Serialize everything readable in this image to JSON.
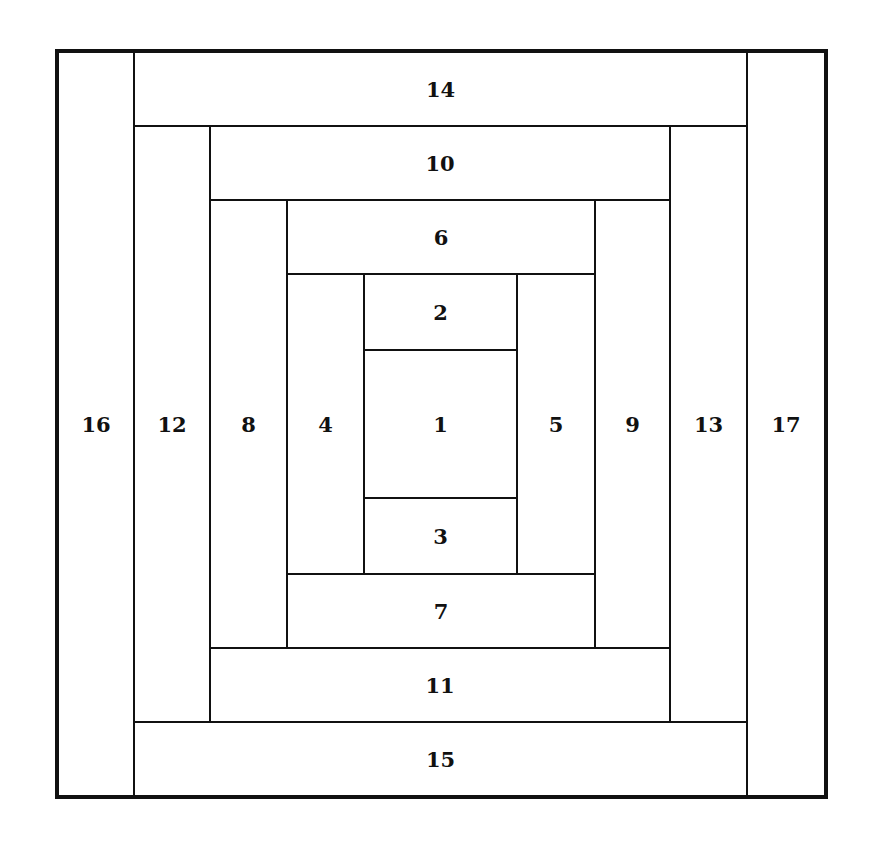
{
  "diagram": {
    "pieces": [
      {
        "label": "1",
        "x": 363,
        "y": 349,
        "w": 155,
        "h": 150
      },
      {
        "label": "2",
        "x": 363,
        "y": 273,
        "w": 155,
        "h": 78
      },
      {
        "label": "3",
        "x": 363,
        "y": 497,
        "w": 155,
        "h": 78
      },
      {
        "label": "4",
        "x": 286,
        "y": 273,
        "w": 79,
        "h": 302
      },
      {
        "label": "5",
        "x": 516,
        "y": 273,
        "w": 80,
        "h": 302
      },
      {
        "label": "6",
        "x": 286,
        "y": 199,
        "w": 310,
        "h": 76
      },
      {
        "label": "7",
        "x": 286,
        "y": 573,
        "w": 310,
        "h": 76
      },
      {
        "label": "8",
        "x": 209,
        "y": 199,
        "w": 79,
        "h": 450
      },
      {
        "label": "9",
        "x": 594,
        "y": 199,
        "w": 77,
        "h": 450
      },
      {
        "label": "10",
        "x": 209,
        "y": 125,
        "w": 462,
        "h": 76
      },
      {
        "label": "11",
        "x": 209,
        "y": 647,
        "w": 462,
        "h": 76
      },
      {
        "label": "12",
        "x": 133,
        "y": 125,
        "w": 78,
        "h": 598
      },
      {
        "label": "13",
        "x": 669,
        "y": 125,
        "w": 79,
        "h": 598
      },
      {
        "label": "14",
        "x": 133,
        "y": 51,
        "w": 615,
        "h": 76
      },
      {
        "label": "15",
        "x": 133,
        "y": 721,
        "w": 615,
        "h": 76
      },
      {
        "label": "16",
        "x": 57,
        "y": 51,
        "w": 78,
        "h": 746
      },
      {
        "label": "17",
        "x": 746,
        "y": 51,
        "w": 80,
        "h": 746
      }
    ]
  }
}
